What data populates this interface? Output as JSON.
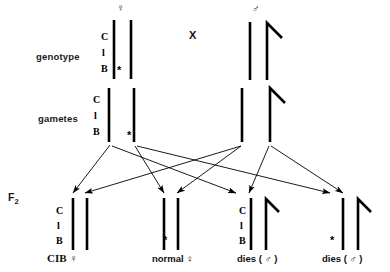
{
  "diagram": {
    "background_color": "#ffffff",
    "ink_color": "#000000",
    "rows": {
      "genotype_label": "genotype",
      "gametes_label": "gametes",
      "f2_label": "F",
      "f2_sub": "2"
    },
    "cross_symbol": "X",
    "symbols": {
      "female": "♀",
      "male": "♂",
      "asterisk": "*"
    },
    "gene_markers": {
      "c": "C",
      "l": "l",
      "b": "B"
    },
    "parents": [
      {
        "name": "female-parent",
        "sex": "♀",
        "genes": [
          "C",
          "l",
          "B"
        ],
        "has_asterisk": true,
        "chromosomes": [
          "X-cib",
          "X-normal"
        ]
      },
      {
        "name": "male-parent",
        "sex": "♂",
        "genes": [],
        "has_asterisk": false,
        "chromosomes": [
          "X",
          "Y"
        ]
      }
    ],
    "gametes": [
      {
        "name": "gamete-cib-x",
        "genes": [
          "C",
          "l",
          "B"
        ],
        "has_asterisk": false,
        "type": "X"
      },
      {
        "name": "gamete-normal-x",
        "genes": [],
        "has_asterisk": true,
        "type": "X"
      },
      {
        "name": "gamete-male-x",
        "genes": [],
        "has_asterisk": false,
        "type": "X"
      },
      {
        "name": "gamete-male-y",
        "genes": [],
        "has_asterisk": false,
        "type": "Y"
      }
    ],
    "offspring": [
      {
        "name": "offspring-cib-female",
        "label": "CIB ♀",
        "genes": [
          "C",
          "l",
          "B"
        ],
        "has_asterisk": false,
        "chromosomes": [
          "X-cib",
          "X"
        ]
      },
      {
        "name": "offspring-normal-female",
        "label": "normal ♀",
        "genes": [],
        "has_asterisk": true,
        "chromosomes": [
          "X-normal",
          "X"
        ]
      },
      {
        "name": "offspring-cib-male",
        "label": "dies ( ♂ )",
        "genes": [
          "C",
          "l",
          "B"
        ],
        "has_asterisk": false,
        "chromosomes": [
          "X-cib",
          "Y"
        ]
      },
      {
        "name": "offspring-treated-male",
        "label": "dies ( ♂ )",
        "genes": [],
        "has_asterisk": true,
        "chromosomes": [
          "X-normal",
          "Y"
        ]
      }
    ]
  }
}
